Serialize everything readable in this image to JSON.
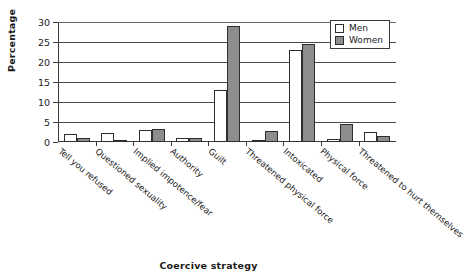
{
  "chart_data": {
    "type": "bar",
    "title": "",
    "xlabel": "Coercive strategy",
    "ylabel": "Percentage",
    "ylim": [
      0,
      30
    ],
    "yticks": [
      0,
      5,
      10,
      15,
      20,
      25,
      30
    ],
    "grid": true,
    "legend_position": "top-right",
    "categories": [
      "Tell you refused",
      "Questioned sexuality",
      "Implied impotence/fear",
      "Authority",
      "Guilt",
      "Threatened physical force",
      "Intoxicated",
      "Physical force",
      "Threatened to hurt themselves"
    ],
    "series": [
      {
        "name": "Men",
        "color": "#ffffff",
        "values": [
          2.0,
          2.3,
          3.0,
          1.0,
          13.0,
          0.4,
          23.0,
          0.8,
          2.5
        ]
      },
      {
        "name": "Women",
        "color": "#8d8d8d",
        "values": [
          1.0,
          0.3,
          3.2,
          1.0,
          29.0,
          2.7,
          24.5,
          4.5,
          1.5
        ]
      }
    ]
  },
  "legend": {
    "items": [
      {
        "label": "Men",
        "swatch": "men"
      },
      {
        "label": "Women",
        "swatch": "women"
      }
    ]
  }
}
